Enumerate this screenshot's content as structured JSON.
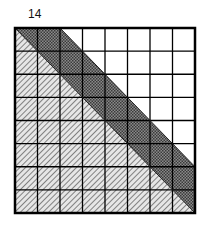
{
  "figure": {
    "label": "14",
    "grid": {
      "rows": 8,
      "cols": 8,
      "regions": [
        {
          "name": "lower-left triangle",
          "pattern": "diagonal hatch",
          "bounds": "below main diagonal"
        },
        {
          "name": "diagonal band",
          "pattern": "dark dotted fill",
          "bounds": "between main diagonal and diagonal offset by 2 columns"
        },
        {
          "name": "upper-right triangle",
          "pattern": "white",
          "bounds": "above offset diagonal"
        }
      ],
      "band_offset_cells": 2
    },
    "colors": {
      "band": "#6e6e6e",
      "hatch": "#555555",
      "lines": "#000000",
      "background": "#ffffff"
    }
  }
}
